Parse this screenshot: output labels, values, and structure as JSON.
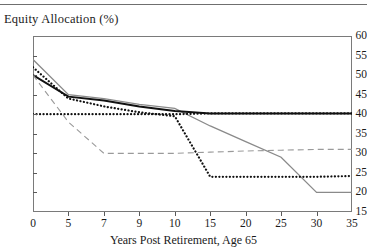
{
  "chart_data": {
    "type": "line",
    "title": "Equity Allocation (%)",
    "xlabel": "Years Post Retirement, Age 65",
    "ylabel": "",
    "categories": [
      0,
      5,
      7,
      9,
      10,
      15,
      20,
      25,
      30,
      35
    ],
    "x_tick_labels": [
      "0",
      "5",
      "7",
      "9",
      "10",
      "15",
      "20",
      "25",
      "30",
      "35"
    ],
    "y_tick_labels": [
      "60",
      "55",
      "50",
      "45",
      "40",
      "35",
      "30",
      "25",
      "20",
      "15"
    ],
    "ylim": [
      15,
      60
    ],
    "ytick_step": 5,
    "grid": false,
    "legend": "none",
    "axis_note": "x-axis is categorical: ticks evenly spaced despite unequal numeric gaps",
    "series": [
      {
        "name": "gray-solid-declining",
        "style": "solid",
        "color": "#8a8a8a",
        "width": 1.3,
        "values": [
          54,
          45,
          44,
          42.5,
          41.5,
          37,
          33,
          29,
          20,
          20
        ]
      },
      {
        "name": "black-solid-thick",
        "style": "solid",
        "color": "#111111",
        "width": 2.0,
        "values": [
          50,
          44.5,
          43.5,
          42,
          40.8,
          40.2,
          40.2,
          40.2,
          40.2,
          40.2
        ]
      },
      {
        "name": "black-dotted-constant-40",
        "style": "dotted",
        "color": "#111111",
        "width": 2.2,
        "values": [
          40,
          40,
          40,
          40,
          40,
          40.2,
          40.2,
          40.2,
          40.2,
          40.2
        ]
      },
      {
        "name": "black-dotted-declining",
        "style": "dotted",
        "color": "#111111",
        "width": 2.2,
        "values": [
          52,
          44,
          42,
          40.5,
          39.5,
          24,
          24,
          24,
          24,
          24.2
        ]
      },
      {
        "name": "gray-dashed-thin",
        "style": "dashed",
        "color": "#9a9a9a",
        "width": 1.1,
        "values": [
          50,
          38,
          30,
          30,
          30,
          30.3,
          30.6,
          30.8,
          31,
          31
        ]
      }
    ]
  }
}
